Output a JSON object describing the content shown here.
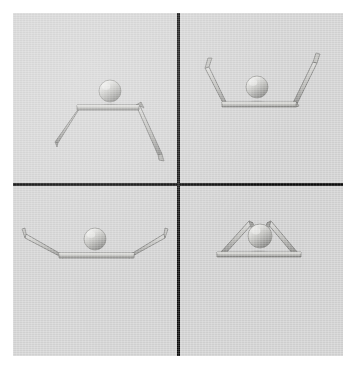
{
  "figure": {
    "caption": "",
    "layout": "2x2 grid",
    "rows": 2,
    "columns": 2,
    "background_color": "#d5d5d5",
    "page_background_color": "#ffffff",
    "divider_color": "#0b0b0b",
    "divider_thickness_px": 3,
    "canvas": {
      "x": 13,
      "y": 13,
      "width": 330,
      "height": 343
    }
  },
  "materials": {
    "arm_light": "#d8d8d6",
    "arm_mid": "#b9b9b6",
    "arm_dark": "#8e8e8c",
    "arm_edge": "#6d6d6b",
    "ball_highlight": "#e9e9e7",
    "ball_mid": "#bdbdba",
    "ball_shadow": "#8a8a88",
    "contact_shadow": "#9a9a98"
  },
  "panels": [
    {
      "id": "panel-top-left",
      "position": "top-left",
      "label": "",
      "description": "Sphere resting on a horizontal beam; left arm angles down-left, right arm angles steeply down-right.",
      "sphere": {
        "cx": 97,
        "cy": 78,
        "r": 11,
        "resting": true
      },
      "beam": {
        "x1": 63,
        "y1": 96,
        "x2": 125,
        "y2": 96,
        "thickness": 5
      },
      "left_arm": {
        "angle_deg": 236,
        "length": 46,
        "hook": false
      },
      "right_arm": {
        "angle_deg": 298,
        "length": 62,
        "hook": true
      }
    },
    {
      "id": "panel-top-right",
      "position": "top-right",
      "label": "",
      "description": "Sphere on a beam with both arms raised outward and upward forming an open cup; small hooks at both tips.",
      "sphere": {
        "cx": 78,
        "cy": 73,
        "r": 11,
        "resting": true
      },
      "beam": {
        "x1": 43,
        "y1": 93,
        "x2": 117,
        "y2": 93,
        "thickness": 5
      },
      "left_arm": {
        "angle_deg": 118,
        "length": 42,
        "hook": true
      },
      "right_arm": {
        "angle_deg": 62,
        "length": 46,
        "hook": true
      }
    },
    {
      "id": "panel-bottom-left",
      "position": "bottom-left",
      "label": "",
      "description": "Sphere on a wide beam with both arms extended almost horizontally, tips tilted slightly upward.",
      "sphere": {
        "cx": 82,
        "cy": 52,
        "r": 11,
        "resting": true
      },
      "beam": {
        "x1": 46,
        "y1": 72,
        "x2": 121,
        "y2": 72,
        "thickness": 5
      },
      "left_arm": {
        "angle_deg": 160,
        "length": 48,
        "hook": true
      },
      "right_arm": {
        "angle_deg": 20,
        "length": 48,
        "hook": true
      }
    },
    {
      "id": "panel-bottom-right",
      "position": "bottom-right",
      "label": "",
      "description": "Sphere on a short beam with both arms folded inward to form a closed triangular tent; hooks point inward at the apex.",
      "sphere": {
        "cx": 80,
        "cy": 50,
        "r": 12,
        "resting": true
      },
      "beam": {
        "x1": 40,
        "y1": 70,
        "x2": 120,
        "y2": 70,
        "thickness": 5
      },
      "left_arm": {
        "angle_deg": 38,
        "length": 46,
        "hook": true
      },
      "right_arm": {
        "angle_deg": 142,
        "length": 46,
        "hook": true
      }
    }
  ]
}
